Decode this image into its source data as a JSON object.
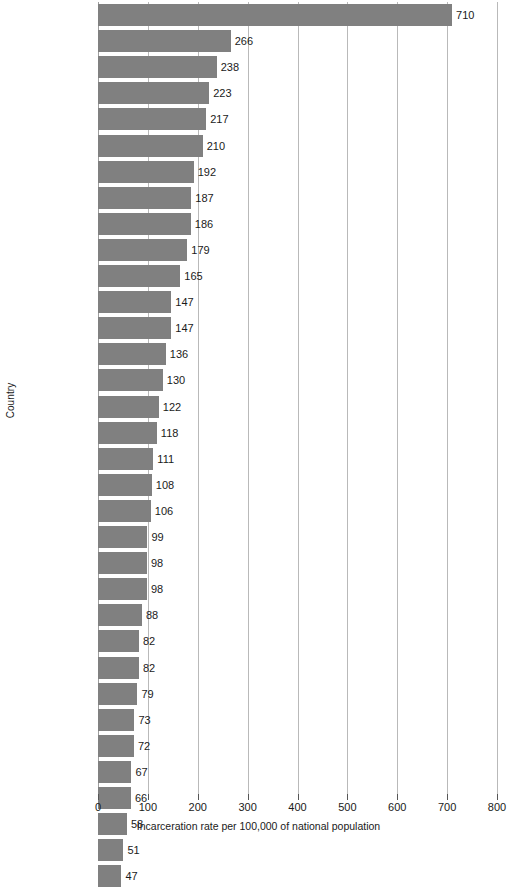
{
  "chart_data": {
    "type": "bar",
    "orientation": "horizontal",
    "title": "",
    "xlabel": "Incarceration rate per 100,000 of national population",
    "ylabel": "Country",
    "xlim": [
      0,
      800
    ],
    "xticks": [
      0,
      100,
      200,
      300,
      400,
      500,
      600,
      700,
      800
    ],
    "xtick_labels": [
      "0",
      "100",
      "200",
      "300",
      "400",
      "500",
      "600",
      "700",
      "800"
    ],
    "grid": "vertical",
    "legend": "none",
    "bar_color": "#808080",
    "gridline_color": "#b9b9b9",
    "background_color": "#ffffff",
    "value_labels_shown": true,
    "categories": [
      "United States",
      "Chile",
      "Estonia",
      "Israel",
      "Poland",
      "Mexico",
      "New Zealand",
      "Slovakia",
      "Hungary",
      "Turkey",
      "Czech Republic",
      "Spain",
      "United Kingdom",
      "Portugal",
      "Australia",
      "Luxembourg",
      "Canada",
      "Greece",
      "Belgium",
      "Italy",
      "South Korea",
      "France",
      "Austria",
      "Ireland",
      "Switzerland",
      "Netherlands",
      "Germany",
      "Denmark",
      "Norway",
      "Sweden",
      "Slovenia",
      "Finland",
      "Japan",
      "Iceland"
    ],
    "values": [
      710,
      266,
      238,
      223,
      217,
      210,
      192,
      187,
      186,
      179,
      165,
      147,
      147,
      136,
      130,
      122,
      118,
      111,
      108,
      106,
      99,
      98,
      98,
      88,
      82,
      82,
      79,
      73,
      72,
      67,
      66,
      58,
      51,
      47
    ],
    "value_label_texts": [
      "710",
      "266",
      "238",
      "223",
      "217",
      "210",
      "192",
      "187",
      "186",
      "179",
      "165",
      "147",
      "147",
      "136",
      "130",
      "122",
      "118",
      "111",
      "108",
      "106",
      "99",
      "98",
      "98",
      "88",
      "82",
      "82",
      "79",
      "73",
      "72",
      "67",
      "66",
      "58",
      "51",
      "47"
    ]
  }
}
